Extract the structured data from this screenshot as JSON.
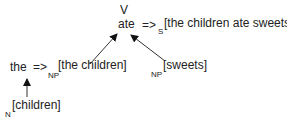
{
  "diagram": {
    "top": {
      "category": "V",
      "word": "ate",
      "arrow": "=>",
      "result_label": "S",
      "result": "[the children ate sweets]"
    },
    "left": {
      "word": "the",
      "arrow": "=>",
      "result_label": "NP",
      "result": "[the children]"
    },
    "right": {
      "result_label": "NP",
      "result": "[sweets]"
    },
    "bottom": {
      "result_label": "N",
      "result": "[children]"
    },
    "edges": [
      {
        "from": "NP[the children]",
        "to": "ate"
      },
      {
        "from": "NP[sweets]",
        "to": "ate"
      },
      {
        "from": "N[children]",
        "to": "the"
      }
    ]
  }
}
